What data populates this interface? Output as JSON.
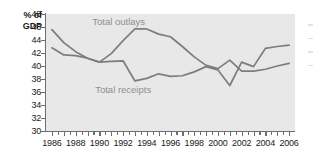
{
  "chart_data": {
    "type": "line",
    "title": "",
    "subtitle": "",
    "xlabel": "",
    "ylabel": "% of GDP",
    "ylabel_line1": "% of",
    "ylabel_line2": "GDP",
    "ylim": [
      30,
      48
    ],
    "ytick_step": 2,
    "yticks": [
      48,
      46,
      44,
      42,
      40,
      38,
      36,
      34,
      32,
      30
    ],
    "xlim": [
      1985.5,
      2006.5
    ],
    "x": [
      1986,
      1987,
      1988,
      1989,
      1990,
      1991,
      1992,
      1993,
      1994,
      1995,
      1996,
      1997,
      1998,
      1999,
      2000,
      2001,
      2002,
      2003,
      2004,
      2005,
      2006
    ],
    "xticks": [
      1986,
      1987,
      1988,
      1989,
      1990,
      1991,
      1992,
      1993,
      1994,
      1995,
      1996,
      1997,
      1998,
      1999,
      2000,
      2001,
      2002,
      2003,
      2004,
      2005,
      2006
    ],
    "xtick_labels": [
      "1986",
      "1988",
      "1990",
      "1992",
      "1994",
      "1996",
      "1998",
      "2000",
      "2002",
      "2004",
      "2006"
    ],
    "xtick_label_years": [
      1986,
      1988,
      1990,
      1992,
      1994,
      1996,
      1998,
      2000,
      2002,
      2004,
      2006
    ],
    "grid": false,
    "legend_position": "inline-annotation",
    "plot_background": "#e8e8e8",
    "line_color": "#7d7d7d",
    "label_color": "#8f8f8f",
    "axis_color": "#6e6e6e",
    "series": [
      {
        "name": "Total outlays",
        "label": "Total outlays",
        "values": [
          45.6,
          43.6,
          42.2,
          41.2,
          40.6,
          41.9,
          43.9,
          45.7,
          45.7,
          44.9,
          44.5,
          43.0,
          41.4,
          40.1,
          39.6,
          40.9,
          39.2,
          39.2,
          39.5,
          40.0,
          40.4
        ]
      },
      {
        "name": "Total receipts",
        "label": "Total receipts",
        "values": [
          42.8,
          41.7,
          41.6,
          41.2,
          40.6,
          40.7,
          40.8,
          37.7,
          38.1,
          38.8,
          38.4,
          38.5,
          39.1,
          39.9,
          39.4,
          37.0,
          40.6,
          39.9,
          42.7,
          43.0,
          43.2
        ]
      }
    ]
  },
  "annotations": {
    "outlays_label": "Total outlays",
    "receipts_label": "Total receipts"
  }
}
